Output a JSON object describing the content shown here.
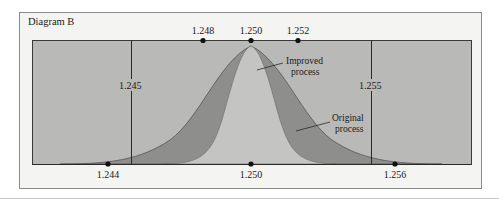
{
  "diagram": {
    "title": "Diagram B",
    "colors": {
      "frame_bg": "#f4f4f2",
      "frame_border": "#8a8a8a",
      "plot_bg": "#b9b9b7",
      "original_fill": "#8e8e8c",
      "improved_fill": "#c4c4c2",
      "line": "#2a2a2a"
    },
    "top_axis": {
      "ticks": [
        {
          "value": "1.248",
          "x": 203
        },
        {
          "value": "1.250",
          "x": 251
        },
        {
          "value": "1.252",
          "x": 298
        }
      ]
    },
    "bottom_axis": {
      "ticks": [
        {
          "value": "1.244",
          "x": 108
        },
        {
          "value": "1.250",
          "x": 251
        },
        {
          "value": "1.256",
          "x": 395
        }
      ]
    },
    "spec_limits": {
      "lower": {
        "value": "1.245",
        "x": 131
      },
      "upper": {
        "value": "1.255",
        "x": 371
      }
    },
    "curves": {
      "improved": {
        "label_line1": "Improved",
        "label_line2": "process"
      },
      "original": {
        "label_line1": "Original",
        "label_line2": "process"
      }
    }
  }
}
